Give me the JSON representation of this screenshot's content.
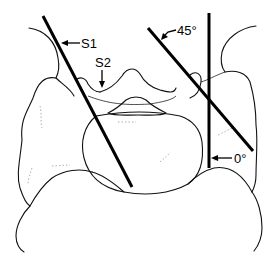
{
  "figure": {
    "type": "anatomical line drawing",
    "labels": {
      "s1": "S1",
      "s2": "S2",
      "angle_45": "45°",
      "angle_0": "0°"
    },
    "lines": [
      {
        "id": "s1-line",
        "from": [
          43,
          16
        ],
        "to": [
          132,
          187
        ]
      },
      {
        "id": "45-degree-line",
        "from": [
          148,
          28
        ],
        "to": [
          253,
          151
        ]
      },
      {
        "id": "0-degree-line",
        "from": [
          209,
          13
        ],
        "to": [
          209,
          168
        ]
      }
    ],
    "colors": {
      "ink": "#000000",
      "background": "#ffffff"
    }
  }
}
